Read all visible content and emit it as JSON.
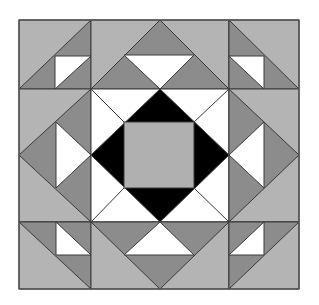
{
  "colors": {
    "light": "#b4b4b4",
    "dark": "#8c8c8c",
    "white": "#ffffff",
    "black": "#000000",
    "center": "#b0b0b0",
    "stroke": "#3a3a3a"
  },
  "grid": {
    "x": [
      19,
      91,
      229,
      299
    ],
    "y": [
      20,
      89,
      222,
      289
    ]
  },
  "blocks": [
    {
      "name": "corner-top-left",
      "type": "half-square-triangle"
    },
    {
      "name": "edge-top",
      "type": "flying-geese"
    },
    {
      "name": "corner-top-right",
      "type": "half-square-triangle"
    },
    {
      "name": "edge-left",
      "type": "flying-geese"
    },
    {
      "name": "center",
      "type": "square-in-diamond"
    },
    {
      "name": "edge-right",
      "type": "flying-geese"
    },
    {
      "name": "corner-bottom-left",
      "type": "half-square-triangle"
    },
    {
      "name": "edge-bottom",
      "type": "flying-geese"
    },
    {
      "name": "corner-bottom-right",
      "type": "half-square-triangle"
    }
  ]
}
